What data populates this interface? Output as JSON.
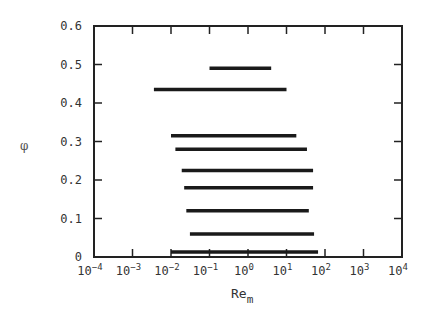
{
  "chart_data": {
    "type": "range-bar",
    "title": "",
    "xlabel": "Re_m",
    "xlabel_main": "Re",
    "xlabel_sub": "m",
    "ylabel": "φ",
    "xscale": "log",
    "xlim": [
      0.0001,
      10000
    ],
    "ylim": [
      0,
      0.6
    ],
    "x_tick_labels": [
      "10^-4",
      "10^-3",
      "10^-2",
      "10^-1",
      "10^0",
      "10^1",
      "10^2",
      "10^3",
      "10^4"
    ],
    "x_tick_exponents": [
      -4,
      -3,
      -2,
      -1,
      0,
      1,
      2,
      3,
      4
    ],
    "y_tick_labels": [
      "0",
      "0.1",
      "0.2",
      "0.3",
      "0.4",
      "0.5",
      "0.6"
    ],
    "y_ticks": [
      0,
      0.1,
      0.2,
      0.3,
      0.4,
      0.5,
      0.6
    ],
    "grid": false,
    "legend": null,
    "series": [
      {
        "name": "range",
        "phi": 0.49,
        "re_min": 0.1,
        "re_max": 4
      },
      {
        "name": "range",
        "phi": 0.435,
        "re_min": 0.0036,
        "re_max": 10
      },
      {
        "name": "range",
        "phi": 0.315,
        "re_min": 0.01,
        "re_max": 18
      },
      {
        "name": "range",
        "phi": 0.28,
        "re_min": 0.013,
        "re_max": 34
      },
      {
        "name": "range",
        "phi": 0.225,
        "re_min": 0.019,
        "re_max": 49
      },
      {
        "name": "range",
        "phi": 0.18,
        "re_min": 0.022,
        "re_max": 49
      },
      {
        "name": "range",
        "phi": 0.12,
        "re_min": 0.025,
        "re_max": 38
      },
      {
        "name": "range",
        "phi": 0.06,
        "re_min": 0.031,
        "re_max": 52
      },
      {
        "name": "range",
        "phi": 0.013,
        "re_min": 0.01,
        "re_max": 66
      }
    ]
  }
}
